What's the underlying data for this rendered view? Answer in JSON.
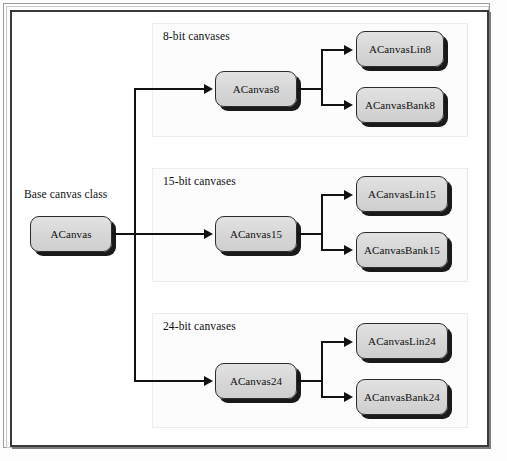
{
  "diagram": {
    "background_color": "#fdfdfd",
    "node_fill_color": "#d6d6d6",
    "node_border_color": "#2b2b2b",
    "line_color": "#121212",
    "base": {
      "caption": "Base canvas class",
      "node_label": "ACanvas"
    },
    "groups": [
      {
        "label": "8-bit canvases",
        "parent": "ACanvas8",
        "children": [
          "ACanvasLin8",
          "ACanvasBank8"
        ]
      },
      {
        "label": "15-bit canvases",
        "parent": "ACanvas15",
        "children": [
          "ACanvasLin15",
          "ACanvasBank15"
        ]
      },
      {
        "label": "24-bit canvases",
        "parent": "ACanvas24",
        "children": [
          "ACanvasLin24",
          "ACanvasBank24"
        ]
      }
    ]
  }
}
